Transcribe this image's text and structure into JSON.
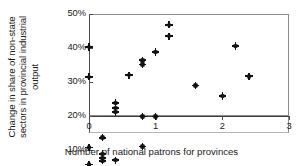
{
  "chart_data": {
    "type": "scatter",
    "title": "",
    "xlabel": "Number of national patrons for provinces",
    "ylabel": "Change in share of non-state sectors in provincial industrial output",
    "ylabel_lines": [
      "Change in share of non-state",
      "sectors in provincial industrial",
      "output"
    ],
    "xlim": [
      0,
      3
    ],
    "ylim": [
      -0.1,
      0.5
    ],
    "grid": false,
    "legend": null,
    "xticks": [
      0,
      1,
      2,
      3
    ],
    "xtick_labels": [
      "0",
      "1",
      "2",
      "3"
    ],
    "yticks": [
      -0.1,
      0.0,
      0.1,
      0.2,
      0.3,
      0.4,
      0.5
    ],
    "ytick_labels": [
      "-10%",
      "0%",
      "10%",
      "20%",
      "30%",
      "40%",
      "50%"
    ],
    "marker": "diamond-dot",
    "marker_color": "#121212",
    "points": [
      {
        "x": 0.0,
        "y": 0.403
      },
      {
        "x": 0.0,
        "y": 0.315
      },
      {
        "x": 0.0,
        "y": 0.108
      },
      {
        "x": 0.0,
        "y": 0.057
      },
      {
        "x": 0.2,
        "y": 0.136
      },
      {
        "x": 0.2,
        "y": 0.088
      },
      {
        "x": 0.2,
        "y": 0.077
      },
      {
        "x": 0.2,
        "y": 0.068
      },
      {
        "x": 0.4,
        "y": 0.238
      },
      {
        "x": 0.4,
        "y": 0.224
      },
      {
        "x": 0.4,
        "y": 0.212
      },
      {
        "x": 0.4,
        "y": 0.07
      },
      {
        "x": 0.6,
        "y": 0.32
      },
      {
        "x": 0.6,
        "y": -0.01
      },
      {
        "x": 0.8,
        "y": 0.364
      },
      {
        "x": 0.8,
        "y": 0.352
      },
      {
        "x": 0.8,
        "y": 0.199
      },
      {
        "x": 0.8,
        "y": 0.11
      },
      {
        "x": 1.0,
        "y": 0.388
      },
      {
        "x": 1.0,
        "y": 0.198
      },
      {
        "x": 1.2,
        "y": 0.468
      },
      {
        "x": 1.2,
        "y": 0.435
      },
      {
        "x": 1.6,
        "y": 0.29
      },
      {
        "x": 2.0,
        "y": 0.259
      },
      {
        "x": 2.2,
        "y": 0.406
      },
      {
        "x": 2.4,
        "y": 0.317
      }
    ]
  }
}
